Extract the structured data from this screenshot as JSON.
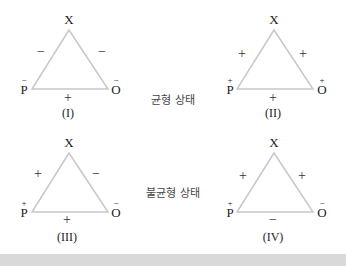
{
  "diagrams": [
    {
      "id": "I",
      "caption": "(I)",
      "top": "X",
      "left": "P",
      "left_sign": "−",
      "right": "O",
      "right_sign": "−",
      "edge_xp": "−",
      "edge_xo": "−",
      "edge_po": "+"
    },
    {
      "id": "II",
      "caption": "(II)",
      "top": "X",
      "left": "P",
      "left_sign": "+",
      "right": "O",
      "right_sign": "+",
      "edge_xp": "+",
      "edge_xo": "+",
      "edge_po": "+"
    },
    {
      "id": "III",
      "caption": "(III)",
      "top": "X",
      "left": "P",
      "left_sign": "+",
      "right": "O",
      "right_sign": "−",
      "edge_xp": "+",
      "edge_xo": "−",
      "edge_po": "+"
    },
    {
      "id": "IV",
      "caption": "(IV)",
      "top": "X",
      "left": "P",
      "left_sign": "+",
      "right": "O",
      "right_sign": "−",
      "edge_xp": "+",
      "edge_xo": "+",
      "edge_po": "−"
    }
  ],
  "states": {
    "balanced": "균형 상태",
    "unbalanced": "불균형 상태"
  },
  "colors": {
    "triangle_stroke": "#c8c8c8",
    "band": "#d9d9d9"
  }
}
